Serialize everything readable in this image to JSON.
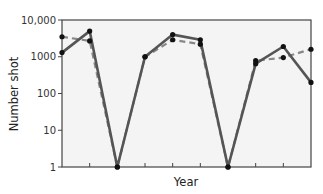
{
  "chart_data": {
    "type": "line",
    "title": "",
    "xlabel": "Year",
    "ylabel": "Number shot",
    "yscale": "log",
    "ylim": [
      1,
      10000
    ],
    "yticks": [
      1,
      10,
      100,
      1000,
      10000
    ],
    "ytick_labels": [
      "1",
      "10",
      "100",
      "1000",
      "10,000"
    ],
    "x": [
      1,
      2,
      3,
      4,
      5,
      6,
      7,
      8,
      9,
      10
    ],
    "xtick_labels": [],
    "grid": false,
    "legend": null,
    "series": [
      {
        "name": "solid",
        "style": "solid",
        "color": "#555555",
        "values": [
          1300,
          5000,
          1,
          1000,
          4000,
          2900,
          1,
          650,
          1900,
          200
        ]
      },
      {
        "name": "dashed",
        "style": "dashed",
        "color": "#888888",
        "values": [
          3500,
          2700,
          1,
          1000,
          2900,
          2200,
          1,
          780,
          950,
          1600
        ]
      }
    ],
    "colors": {
      "frame": "#444444",
      "plot_bg": "#f4f4f4",
      "marker": "#111111"
    }
  }
}
